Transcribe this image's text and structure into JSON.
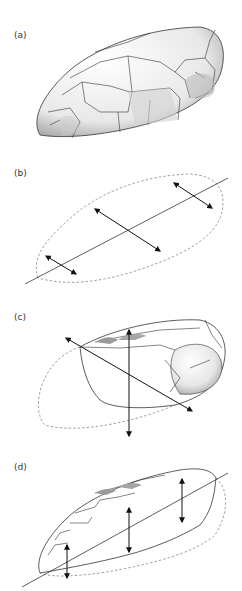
{
  "figure": {
    "panels": [
      {
        "id": "a",
        "label": "(a)",
        "description": "shaded 3D stone-like ellipsoid with polygonal facets"
      },
      {
        "id": "b",
        "label": "(b)",
        "description": "dashed outline of ellipsoid with main axis line and three perpendicular double-headed arrows"
      },
      {
        "id": "c",
        "label": "(c)",
        "description": "partially cut ellipsoid with diagonal double arrow and vertical double arrow, dashed outline of removed portion"
      },
      {
        "id": "d",
        "label": "(d)",
        "description": "flattened ellipsoid section along axis with three vertical double arrows, dashed outline of removed portion"
      }
    ],
    "colors": {
      "stroke": "#333333",
      "dashed": "#888888",
      "shade_dark": "#9a9a9a",
      "fill": "#ffffff"
    }
  }
}
